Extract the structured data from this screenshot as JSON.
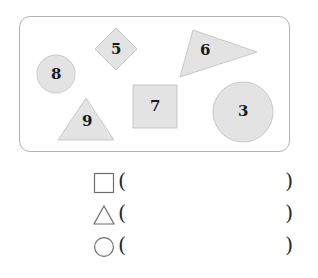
{
  "colors": {
    "shape_fill": "#e3e3e3",
    "shape_stroke": "#c9c9c9",
    "panel_border": "#b3b3b3",
    "glyph_stroke": "#6e6e6e",
    "text": "#1b1b1b",
    "page_background": "#ffffff"
  },
  "figure": {
    "panel_name": "shape-collection-panel",
    "shapes": [
      {
        "id": "circle-8",
        "kind": "circle",
        "label": "8",
        "cx": 56,
        "cy": 74,
        "r": 19,
        "label_x": 51,
        "label_y": 67
      },
      {
        "id": "diamond-5",
        "kind": "diamond",
        "label": "5",
        "points": "116,28 137,49 116,70 95,49",
        "label_x": 111,
        "label_y": 42
      },
      {
        "id": "triangle-6",
        "kind": "triangle",
        "label": "6",
        "points": "193,30 257,52 180,77",
        "label_x": 200,
        "label_y": 43
      },
      {
        "id": "triangle-9",
        "kind": "triangle",
        "label": "9",
        "points": "86,98 114,140 58,140",
        "label_x": 82,
        "label_y": 114
      },
      {
        "id": "square-7",
        "kind": "square",
        "label": "7",
        "x": 133,
        "y": 85,
        "width": 44,
        "height": 43,
        "label_x": 150,
        "label_y": 99
      },
      {
        "id": "circle-3",
        "kind": "circle",
        "label": "3",
        "cx": 243,
        "cy": 112,
        "r": 30,
        "label_x": 238,
        "label_y": 104
      }
    ]
  },
  "answers": {
    "rows": [
      {
        "glyph": "square-outline-icon",
        "shape_name": "square",
        "open_paren": "(",
        "value": "",
        "close_paren": ")"
      },
      {
        "glyph": "triangle-outline-icon",
        "shape_name": "triangle",
        "open_paren": "(",
        "value": "",
        "close_paren": ")"
      },
      {
        "glyph": "circle-outline-icon",
        "shape_name": "circle",
        "open_paren": "(",
        "value": "",
        "close_paren": ")"
      }
    ]
  }
}
